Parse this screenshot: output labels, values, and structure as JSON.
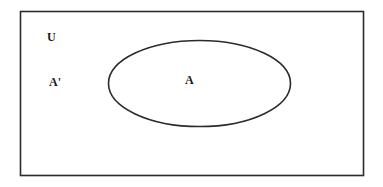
{
  "diagram": {
    "type": "venn",
    "universe": {
      "label": "U",
      "stroke_color": "#2b2b2b"
    },
    "sets": [
      {
        "name": "A",
        "label": "A",
        "stroke_color": "#2b2b2b"
      }
    ],
    "regions": [
      {
        "name": "complement-of-A",
        "label": "A'"
      }
    ]
  }
}
